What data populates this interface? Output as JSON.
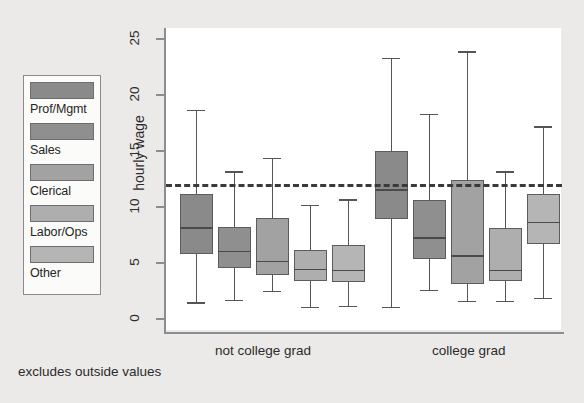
{
  "chart_data": {
    "type": "box",
    "title": "",
    "xlabel": "",
    "ylabel": "hourly wage",
    "ylim": [
      0,
      26.5
    ],
    "yticks": [
      0,
      5,
      10,
      15,
      20,
      25
    ],
    "ytick_labels": [
      "0",
      "5",
      "10",
      "15",
      "20",
      "25"
    ],
    "grid": false,
    "legend_position": "outside-left",
    "footnote": "excludes outside values",
    "reference_line": {
      "value": 12.0,
      "style": "dashed",
      "color": "#3a3a3a",
      "orientation": "horizontal"
    },
    "groups": [
      "not college grad",
      "college grad"
    ],
    "categories": [
      "Prof/Mgmt",
      "Sales",
      "Clerical",
      "Labor/Ops",
      "Other"
    ],
    "category_colors": [
      "#8a8a8a",
      "#8f8f8f",
      "#a2a2a2",
      "#aeaeae",
      "#b5b5b5"
    ],
    "boxes": [
      {
        "group": "not college grad",
        "category": "Prof/Mgmt",
        "lower_whisker": 1.4,
        "q1": 5.7,
        "median": 8.1,
        "q3": 11.1,
        "upper_whisker": 18.6
      },
      {
        "group": "not college grad",
        "category": "Sales",
        "lower_whisker": 1.6,
        "q1": 4.5,
        "median": 6.0,
        "q3": 8.1,
        "upper_whisker": 13.1
      },
      {
        "group": "not college grad",
        "category": "Clerical",
        "lower_whisker": 2.4,
        "q1": 3.8,
        "median": 5.1,
        "q3": 8.9,
        "upper_whisker": 14.3
      },
      {
        "group": "not college grad",
        "category": "Labor/Ops",
        "lower_whisker": 1.0,
        "q1": 3.3,
        "median": 4.4,
        "q3": 6.1,
        "upper_whisker": 10.1
      },
      {
        "group": "not college grad",
        "category": "Other",
        "lower_whisker": 1.1,
        "q1": 3.2,
        "median": 4.3,
        "q3": 6.5,
        "upper_whisker": 10.6
      },
      {
        "group": "college grad",
        "category": "Prof/Mgmt",
        "lower_whisker": 1.0,
        "q1": 8.8,
        "median": 11.5,
        "q3": 14.9,
        "upper_whisker": 23.2
      },
      {
        "group": "college grad",
        "category": "Sales",
        "lower_whisker": 2.5,
        "q1": 5.3,
        "median": 7.2,
        "q3": 10.5,
        "upper_whisker": 18.2
      },
      {
        "group": "college grad",
        "category": "Clerical",
        "lower_whisker": 1.5,
        "q1": 3.0,
        "median": 5.6,
        "q3": 12.3,
        "upper_whisker": 23.8
      },
      {
        "group": "college grad",
        "category": "Labor/Ops",
        "lower_whisker": 1.5,
        "q1": 3.3,
        "median": 4.3,
        "q3": 8.0,
        "upper_whisker": 13.1
      },
      {
        "group": "college grad",
        "category": "Other",
        "lower_whisker": 1.8,
        "q1": 6.6,
        "median": 8.6,
        "q3": 11.1,
        "upper_whisker": 17.1
      }
    ]
  },
  "legend": {
    "items": [
      {
        "label": "Prof/Mgmt",
        "color": "#8a8a8a"
      },
      {
        "label": "Sales",
        "color": "#8f8f8f"
      },
      {
        "label": "Clerical",
        "color": "#a2a2a2"
      },
      {
        "label": "Labor/Ops",
        "color": "#aeaeae"
      },
      {
        "label": "Other",
        "color": "#b5b5b5"
      }
    ]
  },
  "axis": {
    "y_title": "hourly wage",
    "tick_labels": [
      "25",
      "20",
      "15",
      "10",
      "5",
      "0"
    ]
  },
  "groups": {
    "left_label": "not college grad",
    "right_label": "college grad"
  },
  "note": "excludes outside values"
}
